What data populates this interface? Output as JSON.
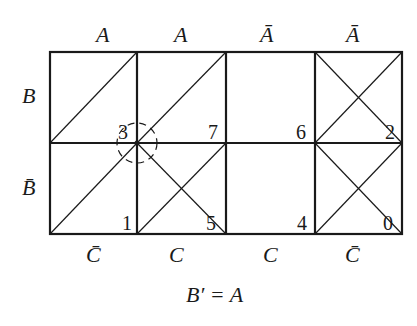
{
  "diagram": {
    "type": "karnaugh-map",
    "top_labels": [
      "A",
      "A",
      "Ā",
      "Ā"
    ],
    "left_labels": [
      "B",
      "B̄"
    ],
    "bottom_labels": [
      "C̄",
      "C",
      "C",
      "C̄"
    ],
    "cells": [
      {
        "row": 0,
        "col": 0,
        "minterm": "3",
        "marks": [
          "slash"
        ]
      },
      {
        "row": 0,
        "col": 1,
        "minterm": "7",
        "marks": [
          "slash"
        ]
      },
      {
        "row": 0,
        "col": 2,
        "minterm": "6",
        "marks": []
      },
      {
        "row": 0,
        "col": 3,
        "minterm": "2",
        "marks": [
          "slash",
          "backslash"
        ]
      },
      {
        "row": 1,
        "col": 0,
        "minterm": "1",
        "marks": [
          "slash"
        ]
      },
      {
        "row": 1,
        "col": 1,
        "minterm": "5",
        "marks": [
          "slash",
          "backslash"
        ]
      },
      {
        "row": 1,
        "col": 2,
        "minterm": "4",
        "marks": []
      },
      {
        "row": 1,
        "col": 3,
        "minterm": "0",
        "marks": [
          "slash",
          "backslash"
        ]
      }
    ],
    "highlight": {
      "shape": "dashed-circle",
      "at": "corner of cells 3,7,1,5"
    },
    "equation": "B′ = A",
    "colors": {
      "line": "#1a1a1a",
      "background": "#ffffff"
    }
  }
}
